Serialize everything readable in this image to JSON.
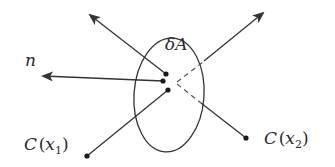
{
  "diagram": {
    "surface_label": "δA",
    "normal_label": "n",
    "point1": {
      "label_prefix": "C",
      "label_var": "x",
      "label_sub": "1"
    },
    "point2": {
      "label_prefix": "C",
      "label_var": "x",
      "label_sub": "2"
    },
    "colors": {
      "stroke": "#333333",
      "background": "#ffffff"
    }
  }
}
